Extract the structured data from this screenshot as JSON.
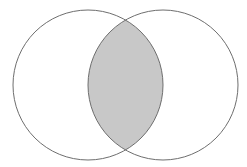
{
  "diagram": {
    "type": "venn",
    "sets": [
      {
        "name": "left-set",
        "cx": 88,
        "cy": 85,
        "r": 75
      },
      {
        "name": "right-set",
        "cx": 163,
        "cy": 85,
        "r": 75
      }
    ],
    "highlighted_region": "intersection",
    "colors": {
      "background": "#ffffff",
      "stroke": "#6e6e6e",
      "intersection_fill": "#c8c8c8"
    }
  }
}
